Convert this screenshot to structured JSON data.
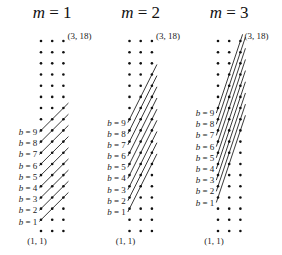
{
  "figure": {
    "grid": {
      "columns": 3,
      "rows": 18
    },
    "corner_labels": {
      "top": "(3, 18)",
      "bottom": "(1, 1)"
    },
    "b_label_prefix": "b = ",
    "b_values": [
      1,
      2,
      3,
      4,
      5,
      6,
      7,
      8,
      9
    ],
    "panels": [
      {
        "title_var": "m",
        "title_eq": " = 1",
        "m": 1
      },
      {
        "title_var": "m",
        "title_eq": " = 2",
        "m": 2
      },
      {
        "title_var": "m",
        "title_eq": " = 3",
        "m": 3
      }
    ]
  }
}
